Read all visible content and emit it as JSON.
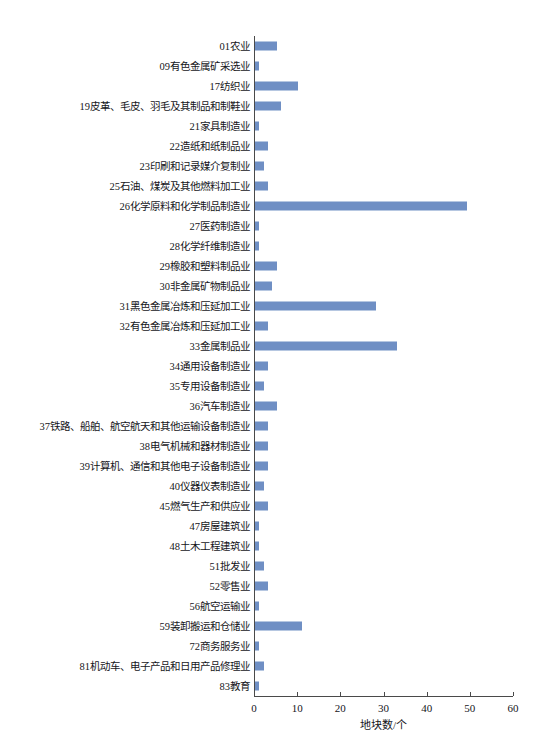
{
  "chart_data": {
    "type": "bar",
    "orientation": "horizontal",
    "title": "",
    "xlabel": "地块数/个",
    "ylabel": "",
    "xlim": [
      0,
      60
    ],
    "xticks": [
      0,
      10,
      20,
      30,
      40,
      50,
      60
    ],
    "grid": false,
    "legend": false,
    "bar_color": "#6f8fc4",
    "axis_color": "#4a4a4a",
    "categories": [
      "01农业",
      "09有色金属矿采选业",
      "17纺织业",
      "19皮革、毛皮、羽毛及其制品和制鞋业",
      "21家具制造业",
      "22造纸和纸制品业",
      "23印刷和记录媒介复制业",
      "25石油、煤炭及其他燃料加工业",
      "26化学原料和化学制品制造业",
      "27医药制造业",
      "28化学纤维制造业",
      "29橡胶和塑料制品业",
      "30非金属矿物制品业",
      "31黑色金属冶炼和压延加工业",
      "32有色金属冶炼和压延加工业",
      "33金属制品业",
      "34通用设备制造业",
      "35专用设备制造业",
      "36汽车制造业",
      "37铁路、船舶、航空航天和其他运输设备制造业",
      "38电气机械和器材制造业",
      "39计算机、通信和其他电子设备制造业",
      "40仪器仪表制造业",
      "45燃气生产和供应业",
      "47房屋建筑业",
      "48土木工程建筑业",
      "51批发业",
      "52零售业",
      "56航空运输业",
      "59装卸搬运和仓储业",
      "72商务服务业",
      "81机动车、电子产品和日用产品修理业",
      "83教育"
    ],
    "values": [
      5,
      1,
      10,
      6,
      1,
      3,
      2,
      3,
      49,
      1,
      1,
      5,
      4,
      28,
      3,
      33,
      3,
      2,
      5,
      3,
      3,
      3,
      2,
      3,
      1,
      1,
      2,
      3,
      1,
      11,
      1,
      2,
      1
    ]
  }
}
